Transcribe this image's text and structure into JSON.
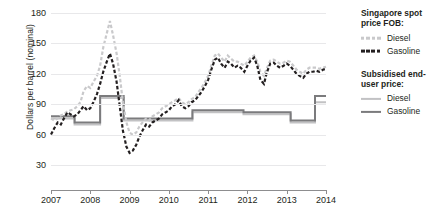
{
  "chart_data": {
    "type": "line",
    "title": "",
    "xlabel": "",
    "ylabel": "Dollars per barrel (nominal)",
    "ylim": [
      30,
      180
    ],
    "xlim": [
      2007,
      2014
    ],
    "yticks": [
      180,
      150,
      120,
      90,
      60,
      30
    ],
    "xticks": [
      "2007",
      "2008",
      "2009",
      "2010",
      "2011",
      "2012",
      "2013",
      "2014"
    ],
    "grid": true,
    "legend_position": "right",
    "series": [
      {
        "name": "Singapore spot price FOB: Diesel",
        "style": "dashed",
        "color": "#c9c9cb",
        "x": [
          2007.0,
          2007.08,
          2007.17,
          2007.25,
          2007.33,
          2007.42,
          2007.5,
          2007.58,
          2007.67,
          2007.75,
          2007.83,
          2007.92,
          2008.0,
          2008.08,
          2008.17,
          2008.25,
          2008.33,
          2008.42,
          2008.5,
          2008.58,
          2008.67,
          2008.75,
          2008.83,
          2008.92,
          2009.0,
          2009.08,
          2009.17,
          2009.25,
          2009.33,
          2009.42,
          2009.5,
          2009.58,
          2009.67,
          2009.75,
          2009.83,
          2009.92,
          2010.0,
          2010.08,
          2010.17,
          2010.25,
          2010.33,
          2010.42,
          2010.5,
          2010.58,
          2010.67,
          2010.75,
          2010.83,
          2010.92,
          2011.0,
          2011.08,
          2011.17,
          2011.25,
          2011.33,
          2011.42,
          2011.5,
          2011.58,
          2011.67,
          2011.75,
          2011.83,
          2011.92,
          2012.0,
          2012.08,
          2012.17,
          2012.25,
          2012.33,
          2012.42,
          2012.5,
          2012.58,
          2012.67,
          2012.75,
          2012.83,
          2012.92,
          2013.0,
          2013.08,
          2013.17,
          2013.25,
          2013.33,
          2013.42,
          2013.5,
          2013.58,
          2013.67,
          2013.75,
          2013.83,
          2013.92,
          2014.0
        ],
        "values": [
          76,
          74,
          76,
          79,
          80,
          83,
          84,
          85,
          88,
          92,
          103,
          108,
          106,
          112,
          118,
          128,
          146,
          160,
          172,
          158,
          140,
          118,
          92,
          72,
          62,
          60,
          62,
          68,
          72,
          76,
          74,
          78,
          80,
          82,
          86,
          88,
          90,
          92,
          94,
          96,
          92,
          90,
          92,
          95,
          97,
          102,
          106,
          112,
          118,
          128,
          138,
          140,
          136,
          132,
          138,
          135,
          132,
          132,
          130,
          128,
          132,
          136,
          138,
          132,
          122,
          118,
          126,
          133,
          134,
          132,
          130,
          131,
          133,
          132,
          128,
          124,
          122,
          120,
          124,
          126,
          126,
          126,
          125,
          126,
          127
        ]
      },
      {
        "name": "Singapore spot price FOB: Gasoline",
        "style": "dashed",
        "color": "#231f20",
        "x": [
          2007.0,
          2007.08,
          2007.17,
          2007.25,
          2007.33,
          2007.42,
          2007.5,
          2007.58,
          2007.67,
          2007.75,
          2007.83,
          2007.92,
          2008.0,
          2008.08,
          2008.17,
          2008.25,
          2008.33,
          2008.42,
          2008.5,
          2008.58,
          2008.67,
          2008.75,
          2008.83,
          2008.92,
          2009.0,
          2009.08,
          2009.17,
          2009.25,
          2009.33,
          2009.42,
          2009.5,
          2009.58,
          2009.67,
          2009.75,
          2009.83,
          2009.92,
          2010.0,
          2010.08,
          2010.17,
          2010.25,
          2010.33,
          2010.42,
          2010.5,
          2010.58,
          2010.67,
          2010.75,
          2010.83,
          2010.92,
          2011.0,
          2011.08,
          2011.17,
          2011.25,
          2011.33,
          2011.42,
          2011.5,
          2011.58,
          2011.67,
          2011.75,
          2011.83,
          2011.92,
          2012.0,
          2012.08,
          2012.17,
          2012.25,
          2012.33,
          2012.42,
          2012.5,
          2012.58,
          2012.67,
          2012.75,
          2012.83,
          2012.92,
          2013.0,
          2013.08,
          2013.17,
          2013.25,
          2013.33,
          2013.42,
          2013.5,
          2013.58,
          2013.67,
          2013.75,
          2013.83,
          2013.92,
          2014.0
        ],
        "values": [
          60,
          66,
          72,
          70,
          76,
          82,
          80,
          78,
          80,
          84,
          88,
          84,
          86,
          92,
          100,
          110,
          122,
          132,
          140,
          130,
          112,
          88,
          64,
          48,
          42,
          44,
          50,
          58,
          64,
          70,
          68,
          72,
          74,
          76,
          80,
          82,
          84,
          88,
          90,
          94,
          88,
          86,
          88,
          92,
          94,
          98,
          102,
          108,
          114,
          124,
          134,
          136,
          130,
          126,
          132,
          130,
          126,
          128,
          126,
          122,
          128,
          133,
          136,
          128,
          114,
          110,
          122,
          130,
          131,
          128,
          126,
          128,
          130,
          128,
          124,
          120,
          118,
          116,
          120,
          122,
          122,
          123,
          122,
          124,
          125
        ]
      },
      {
        "name": "Subsidised end-user price: Diesel",
        "style": "solid",
        "color": "#c2c2c4",
        "x": [
          2007.0,
          2007.6,
          2007.6,
          2008.25,
          2008.25,
          2008.85,
          2008.85,
          2010.6,
          2010.6,
          2011.9,
          2011.9,
          2013.1,
          2013.1,
          2013.72,
          2013.72,
          2014.0
        ],
        "values": [
          76,
          76,
          70,
          70,
          96,
          96,
          74,
          74,
          82,
          82,
          80,
          80,
          72,
          72,
          92,
          92
        ]
      },
      {
        "name": "Subsidised end-user price: Gasoline",
        "style": "solid",
        "color": "#7b7b7d",
        "x": [
          2007.0,
          2007.6,
          2007.6,
          2008.25,
          2008.25,
          2008.85,
          2008.85,
          2010.6,
          2010.6,
          2011.9,
          2011.9,
          2013.1,
          2013.1,
          2013.72,
          2013.72,
          2014.0
        ],
        "values": [
          78,
          78,
          72,
          72,
          98,
          98,
          76,
          76,
          84,
          84,
          82,
          82,
          74,
          74,
          98,
          98
        ]
      }
    ]
  },
  "axis": {
    "ylabel": "Dollars per barrel (nominal)"
  },
  "legend": {
    "groups": [
      {
        "title": "Singapore spot price FOB:",
        "items": [
          {
            "label": "Diesel",
            "swatch": "dashed-light-line-icon"
          },
          {
            "label": "Gasoline",
            "swatch": "dashed-dark-line-icon"
          }
        ]
      },
      {
        "title": "Subsidised end-user price:",
        "items": [
          {
            "label": "Diesel",
            "swatch": "solid-light-line-icon"
          },
          {
            "label": "Gasoline",
            "swatch": "solid-dark-line-icon"
          }
        ]
      }
    ]
  }
}
